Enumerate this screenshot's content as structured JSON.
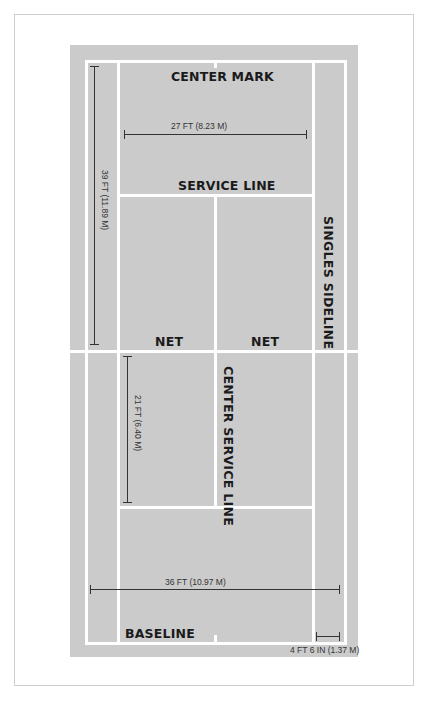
{
  "diagram": {
    "colors": {
      "court": "#cbcbcb",
      "lines": "#ffffff",
      "text": "#1a1a1a",
      "dimension": "#333333"
    },
    "labels": {
      "center_mark": "CENTER MARK",
      "service_line": "SERVICE LINE",
      "singles_sideline": "SINGLES SIDELINE",
      "net_left": "NET",
      "net_right": "NET",
      "center_service_line": "CENTER SERVICE LINE",
      "baseline": "BASELINE"
    },
    "dimensions": {
      "singles_width": "27 FT (8.23 M)",
      "half_length": "39 FT (11.89 M)",
      "service_box_length": "21 FT (6.40 M)",
      "doubles_width": "36 FT (10.97 M)",
      "alley_width": "4 FT 6 IN (1.37 M)"
    }
  }
}
